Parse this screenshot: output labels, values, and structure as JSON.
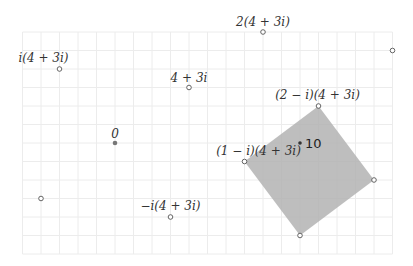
{
  "diagram": {
    "unit_px": 18.5,
    "origin_px": [
      115,
      143
    ],
    "grid": {
      "x_range": [
        -5,
        15
      ],
      "y_range": [
        -6,
        6
      ],
      "color": "#ececec"
    },
    "colors": {
      "square_fill": "#b3b3b3",
      "point_stroke": "#555555",
      "origin_fill": "#777777",
      "ten_fill": "#333333",
      "text": "#333333"
    },
    "points": [
      {
        "id": "origin",
        "re": 0,
        "im": 0,
        "label": "0",
        "style": "filled-gray",
        "label_dx": 0,
        "label_dy": -5,
        "anchor": "middle"
      },
      {
        "id": "z",
        "re": 4,
        "im": 3,
        "label": "4 + 3i",
        "style": "open",
        "label_dx": 0,
        "label_dy": -6,
        "anchor": "middle"
      },
      {
        "id": "2z",
        "re": 8,
        "im": 6,
        "label": "2(4 + 3i)",
        "style": "open",
        "label_dx": 0,
        "label_dy": -6,
        "anchor": "middle"
      },
      {
        "id": "iz",
        "re": -3,
        "im": 4,
        "label": "i(4 + 3i)",
        "style": "open",
        "label_dx": -16,
        "label_dy": -7,
        "anchor": "middle"
      },
      {
        "id": "neg-iz",
        "re": 3,
        "im": -4,
        "label": "−i(4 + 3i)",
        "style": "open",
        "label_dx": 0,
        "label_dy": -7,
        "anchor": "middle"
      },
      {
        "id": "2-i-z",
        "re": 11,
        "im": 2,
        "label": "(2 − i)(4 + 3i)",
        "style": "open",
        "label_dx": -1,
        "label_dy": -7,
        "anchor": "middle"
      },
      {
        "id": "1-i-z",
        "re": 7,
        "im": -1,
        "label": "(1 − i)(4 + 3i)",
        "style": "open",
        "label_dx": 14,
        "label_dy": -7,
        "anchor": "middle"
      },
      {
        "id": "ten",
        "re": 10,
        "im": 0,
        "label": "10",
        "style": "filled-dark",
        "label_dx": 5,
        "label_dy": 5,
        "anchor": "start"
      },
      {
        "id": "corner-14-2i",
        "re": 14,
        "im": -2,
        "label": "",
        "style": "open"
      },
      {
        "id": "corner-10-5i",
        "re": 10,
        "im": -5,
        "label": "",
        "style": "open"
      },
      {
        "id": "p-15-5i",
        "re": 15,
        "im": 5,
        "label": "",
        "style": "open"
      },
      {
        "id": "p-neg4-neg3i",
        "re": -4,
        "im": -3,
        "label": "",
        "style": "open"
      }
    ],
    "square": [
      {
        "re": 7,
        "im": -1
      },
      {
        "re": 11,
        "im": 2
      },
      {
        "re": 14,
        "im": -2
      },
      {
        "re": 10,
        "im": -5
      }
    ]
  }
}
